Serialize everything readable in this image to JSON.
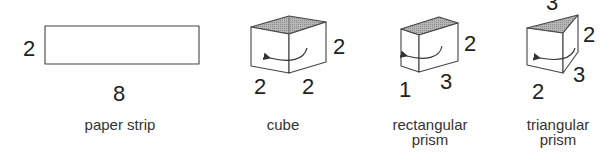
{
  "figures": [
    {
      "id": "paper-strip",
      "caption": "paper strip",
      "dimensions": {
        "height": "2",
        "length": "8"
      }
    },
    {
      "id": "cube",
      "caption": "cube",
      "dimensions": {
        "height": "2",
        "front_width": "2",
        "side_width": "2"
      }
    },
    {
      "id": "rectangular-prism",
      "caption_line1": "rectangular",
      "caption_line2": "prism",
      "dimensions": {
        "height": "2",
        "front_width": "1",
        "side_width": "3"
      }
    },
    {
      "id": "triangular-prism",
      "caption_line1": "triangular",
      "caption_line2": "prism",
      "dimensions": {
        "top_edge": "3",
        "height": "2",
        "side_width": "3",
        "front_width": "2"
      }
    }
  ],
  "colors": {
    "stroke": "#444444",
    "shade": "#9a9a9a",
    "text": "#222222"
  }
}
